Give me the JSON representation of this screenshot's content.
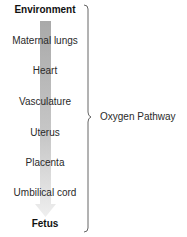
{
  "diagram": {
    "type": "vertical-flow-with-brace",
    "stages": [
      {
        "label": "Environment",
        "bold": true
      },
      {
        "label": "Maternal lungs",
        "bold": false
      },
      {
        "label": "Heart",
        "bold": false
      },
      {
        "label": "Vasculature",
        "bold": false
      },
      {
        "label": "Uterus",
        "bold": false
      },
      {
        "label": "Placenta",
        "bold": false
      },
      {
        "label": "Umbilical cord",
        "bold": false
      },
      {
        "label": "Fetus",
        "bold": true
      }
    ],
    "brace_label": "Oxygen Pathway",
    "arrow": {
      "direction": "down",
      "color_top": "#a9a9a9",
      "color_bottom": "#ededed"
    }
  }
}
